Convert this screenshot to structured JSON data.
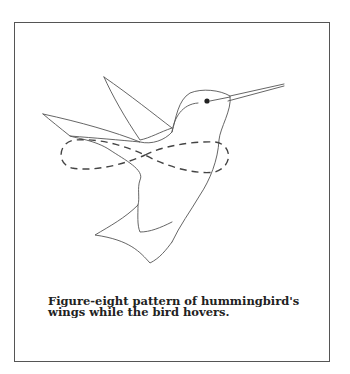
{
  "figure": {
    "caption_lines": [
      "Figure-eight pattern of hummingbird's",
      "wings while the bird hovers."
    ],
    "overlay": "dashed figure-eight wing path",
    "colors": {
      "outline": "#555555",
      "dashed_path": "#444444",
      "eye": "#222222",
      "frame": "#555555",
      "background": "#ffffff"
    }
  }
}
